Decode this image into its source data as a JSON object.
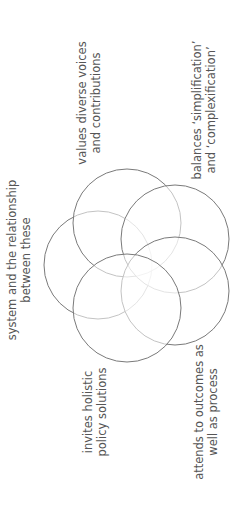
{
  "diagram": {
    "type": "overlapping-circles",
    "orientation": "rotated -90deg",
    "stroke_color": "#7a7a7a",
    "circles": [
      {
        "id": "systems",
        "cx": 98,
        "cy": 265,
        "r": 54
      },
      {
        "id": "voices",
        "cx": 127,
        "cy": 223,
        "r": 54
      },
      {
        "id": "balances",
        "cx": 175,
        "cy": 239,
        "r": 54
      },
      {
        "id": "outcomes",
        "cx": 175,
        "cy": 291,
        "r": 54
      },
      {
        "id": "holistic",
        "cx": 127,
        "cy": 308,
        "r": 54
      }
    ],
    "labels": [
      {
        "id": "systems",
        "line1": "system and the relationship",
        "line2": "between these",
        "x": 19,
        "y": 260
      },
      {
        "id": "voices",
        "line1": "values diverse voices",
        "line2": "and contributions",
        "x": 89,
        "y": 103
      },
      {
        "id": "balances",
        "line1": "balances ‘simplification’",
        "line2": "and ‘complexification’",
        "x": 204,
        "y": 110
      },
      {
        "id": "holistic",
        "line1": "invites holistic",
        "line2": "policy solutions",
        "x": 95,
        "y": 412
      },
      {
        "id": "outcomes",
        "line1": "attends to outcomes as",
        "line2": "well as process",
        "x": 206,
        "y": 412
      }
    ]
  }
}
